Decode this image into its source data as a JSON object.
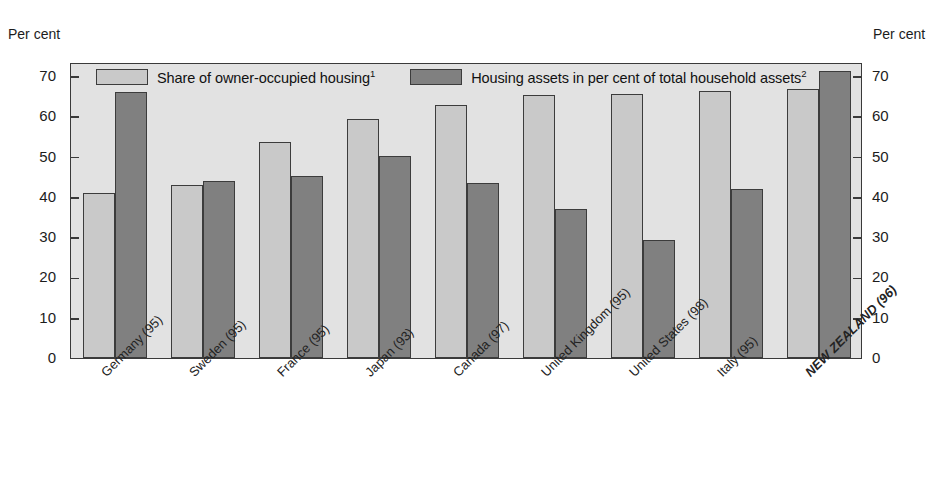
{
  "axis": {
    "left_caption": "Per cent",
    "right_caption": "Per cent",
    "ticks": [
      "70",
      "60",
      "50",
      "40",
      "30",
      "20",
      "10",
      "0"
    ]
  },
  "legend": {
    "items": [
      {
        "label": "Share of owner-occupied housing",
        "footnote": "1",
        "swatch": "light",
        "color": "#c9c9c9"
      },
      {
        "label": "Housing assets in per cent of total household assets",
        "footnote": "2",
        "swatch": "dark",
        "color": "#808080"
      }
    ]
  },
  "chart_data": {
    "type": "bar",
    "title": "",
    "xlabel": "",
    "ylabel": "Per cent",
    "ylim": [
      0,
      75
    ],
    "yticks": [
      0,
      10,
      20,
      30,
      40,
      50,
      60,
      70
    ],
    "grid": false,
    "legend_position": "top-inside",
    "categories": [
      "Germany (95)",
      "Sweden (95)",
      "France (95)",
      "Japan (93)",
      "Canada (97)",
      "United Kingdom (95)",
      "United States (98)",
      "Italy (95)",
      "NEW ZEALAND (96)"
    ],
    "highlight_category": "NEW ZEALAND (96)",
    "series": [
      {
        "name": "Share of owner-occupied housing",
        "color": "#c9c9c9",
        "values": [
          41.0,
          43.0,
          53.6,
          59.3,
          62.8,
          65.4,
          65.6,
          66.2,
          66.8
        ]
      },
      {
        "name": "Housing assets in per cent of total household assets",
        "color": "#808080",
        "values": [
          66.0,
          44.0,
          45.3,
          50.2,
          43.4,
          37.0,
          29.2,
          42.0,
          71.2
        ]
      }
    ]
  }
}
